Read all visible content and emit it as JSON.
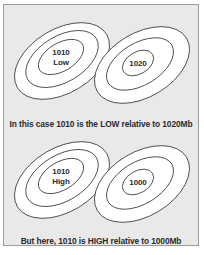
{
  "figure": {
    "background_color": "#e9e9e9",
    "border_color": "#9a9a9a",
    "contour_stroke_color": "#3b3b3b",
    "contour_fill_color": "#ffffff",
    "text_color": "#2b2b2b"
  },
  "panels": [
    {
      "id": "top",
      "caption": "In this case 1010 is the LOW relative to 1020Mb",
      "blobs": [
        {
          "id": "top-left",
          "position": "left",
          "ring_count": 3,
          "labels": [
            "1010",
            "Low"
          ],
          "label_line1": "1010",
          "label_line2": "Low"
        },
        {
          "id": "top-right",
          "position": "right",
          "ring_count": 3,
          "labels": [
            "1020"
          ],
          "label_line1": "1020",
          "label_line2": ""
        }
      ]
    },
    {
      "id": "bottom",
      "caption": "But here, 1010 is HIGH relative to 1000Mb",
      "blobs": [
        {
          "id": "bottom-left",
          "position": "left",
          "ring_count": 3,
          "labels": [
            "1010",
            "High"
          ],
          "label_line1": "1010",
          "label_line2": "High"
        },
        {
          "id": "bottom-right",
          "position": "right",
          "ring_count": 3,
          "labels": [
            "1000"
          ],
          "label_line1": "1000",
          "label_line2": ""
        }
      ]
    }
  ]
}
